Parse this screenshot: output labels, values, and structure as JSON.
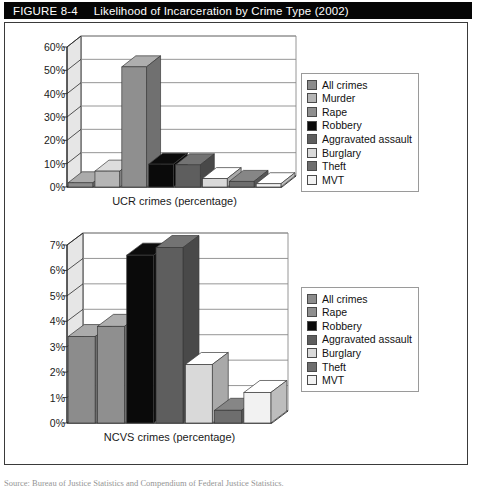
{
  "header": {
    "figure_number": "FIGURE 8-4",
    "figure_title": "Likelihood of Incarceration by Crime Type (2002)"
  },
  "source": {
    "text": "Source: Bureau of Justice Statistics and Compendium of Federal Justice Statistics."
  },
  "palette": {
    "all_crimes": "#8c8c8c",
    "murder": "#b5b5b5",
    "rape": "#8f8f8f",
    "robbery": "#0a0a0a",
    "aggravated_assault": "#5e5e5e",
    "burglary": "#d9d9d9",
    "theft": "#6e6e6e",
    "mvt": "#f2f2f2",
    "axis": "#2b2b2b",
    "grid": "#8a8a8a",
    "header_bg": "#050505",
    "header_fg": "#ffffff",
    "frame_border": "#3a3a3a"
  },
  "chart_data": [
    {
      "id": "ucr",
      "type": "bar",
      "title": "",
      "xlabel": "UCR crimes (percentage)",
      "ylabel": "",
      "ylim": [
        0,
        60
      ],
      "ytick_labels": [
        "0%",
        "10%",
        "20%",
        "30%",
        "40%",
        "50%",
        "60%"
      ],
      "ytick_values": [
        0,
        10,
        20,
        30,
        40,
        50,
        60
      ],
      "grid": true,
      "legend_position": "right",
      "categories": [
        "All crimes",
        "Murder",
        "Rape",
        "Robbery",
        "Aggravated assault",
        "Burglary",
        "Theft",
        "MVT"
      ],
      "values": [
        1.8,
        6.8,
        51.5,
        9.8,
        9.5,
        3.6,
        2.4,
        1.4
      ],
      "colors": [
        "#8c8c8c",
        "#b5b5b5",
        "#8f8f8f",
        "#0a0a0a",
        "#5e5e5e",
        "#d9d9d9",
        "#6e6e6e",
        "#f2f2f2"
      ]
    },
    {
      "id": "ncvs",
      "type": "bar",
      "title": "",
      "xlabel": "NCVS crimes (percentage)",
      "ylabel": "",
      "ylim": [
        0,
        7
      ],
      "ytick_labels": [
        "0%",
        "1%",
        "2%",
        "3%",
        "4%",
        "5%",
        "6%",
        "7%"
      ],
      "ytick_values": [
        0,
        1,
        2,
        3,
        4,
        5,
        6,
        7
      ],
      "grid": true,
      "legend_position": "right",
      "categories": [
        "All crimes",
        "Rape",
        "Robbery",
        "Aggravated assault",
        "Burglary",
        "Theft",
        "MVT"
      ],
      "values": [
        3.4,
        3.8,
        6.6,
        6.9,
        2.3,
        0.5,
        1.2
      ],
      "colors": [
        "#8c8c8c",
        "#8f8f8f",
        "#0a0a0a",
        "#5e5e5e",
        "#d9d9d9",
        "#6e6e6e",
        "#f2f2f2"
      ]
    }
  ]
}
